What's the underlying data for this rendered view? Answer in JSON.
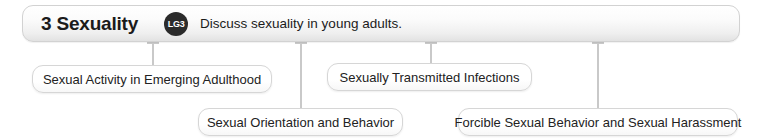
{
  "header": {
    "title": "3 Sexuality",
    "badge": "LG3",
    "badge_icon": "learning-goal-badge-icon",
    "description": "Discuss sexuality in young adults."
  },
  "topics": [
    {
      "label": "Sexual Activity in Emerging Adulthood",
      "left": 32,
      "top": 65,
      "width": 240,
      "connector_x": 152,
      "connector_top": 42,
      "connector_height": 23,
      "cap": true
    },
    {
      "label": "Sexually Transmitted Infections",
      "left": 327,
      "top": 63,
      "width": 205,
      "connector_x": 430,
      "connector_top": 42,
      "connector_height": 21,
      "cap": true
    },
    {
      "label": "Sexual Orientation and Behavior",
      "left": 198,
      "top": 108,
      "width": 205,
      "connector_x": 300,
      "connector_top": 42,
      "connector_height": 66,
      "cap": true
    },
    {
      "label": "Forcible Sexual Behavior and Sexual Harassment",
      "left": 458,
      "top": 108,
      "width": 280,
      "connector_x": 597,
      "connector_top": 42,
      "connector_height": 66,
      "cap": true
    }
  ],
  "colors": {
    "connector": "#c9c9c9",
    "box_border": "#d6d6d6",
    "badge_fill": "#2b2b2b",
    "text": "#1b1b1b",
    "background": "#ffffff"
  }
}
